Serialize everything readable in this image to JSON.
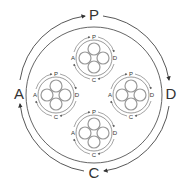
{
  "diagram": {
    "stroke_color": "#444444",
    "inner_stroke_color": "#888888",
    "outer_cycle": {
      "labels": {
        "top": "P",
        "right": "D",
        "bottom": "C",
        "left": "A"
      },
      "direction": "clockwise"
    },
    "sub_cycles": [
      {
        "position": "top",
        "labels": {
          "top": "P",
          "right": "D",
          "bottom": "C",
          "left": "A"
        }
      },
      {
        "position": "left",
        "labels": {
          "top": "P",
          "right": "D",
          "bottom": "C",
          "left": "A"
        }
      },
      {
        "position": "right",
        "labels": {
          "top": "P",
          "right": "D",
          "bottom": "C",
          "left": "A"
        }
      },
      {
        "position": "bottom",
        "labels": {
          "top": "P",
          "right": "D",
          "bottom": "C",
          "left": "A"
        }
      }
    ]
  }
}
